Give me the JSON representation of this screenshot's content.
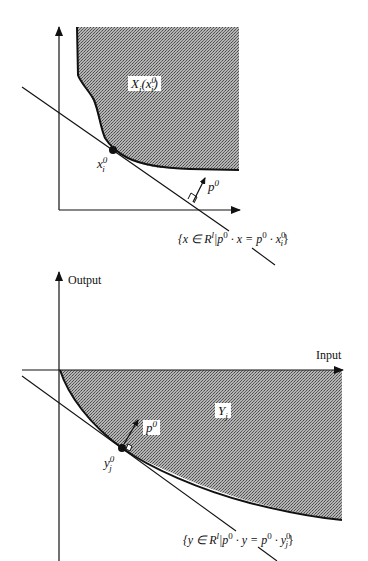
{
  "colors": {
    "fill": "#9a9a9a",
    "ink": "#111111",
    "background": "#ffffff"
  },
  "top_panel": {
    "region_label": {
      "base": "X",
      "sub": "i",
      "open": "(",
      "arg_base": "x",
      "arg_sup": "0",
      "arg_sub": "i",
      "close": ")"
    },
    "point_label": {
      "base": "x",
      "sup": "0",
      "sub": "i"
    },
    "price_label": {
      "base": "p",
      "sup": "0"
    },
    "hyperplane_label": "{x ∈ Rˡ | p⁰ · x = p⁰ · xᵢ⁰}",
    "hyperplane_parts": {
      "open": "{x ∈ R",
      "sup_l": "l",
      "mid": "|p",
      "sup0a": "0",
      "dot1": " · x = p",
      "sup0b": "0",
      "dot2": " · x",
      "sup0c": "0",
      "subi": "i",
      "close": "}"
    }
  },
  "bottom_panel": {
    "y_axis_label": "Output",
    "x_axis_label": "Input",
    "region_label": {
      "base": "Y",
      "sub": "j"
    },
    "point_label": {
      "base": "y",
      "sup": "0",
      "sub": "j"
    },
    "price_label": {
      "base": "p",
      "sup": "0"
    },
    "hyperplane_label": "{y ∈ Rˡ | p⁰ · y = p⁰ · yⱼ⁰}",
    "hyperplane_parts": {
      "open": "{y ∈ R",
      "sup_l": "l",
      "mid": "|p",
      "sup0a": "0",
      "dot1": " · y = p",
      "sup0b": "0",
      "dot2": " · y",
      "sup0c": "0",
      "subj": "j",
      "close": "}"
    }
  }
}
